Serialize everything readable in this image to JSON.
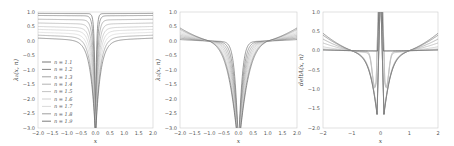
{
  "chart_data": [
    {
      "type": "line",
      "panel": "left",
      "title": "",
      "xlabel": "x",
      "ylabel": "λ₁(x, n)",
      "xlim": [
        -2.0,
        2.0
      ],
      "ylim": [
        -3.0,
        1.0
      ],
      "xticks": [
        "-2.0",
        "-1.5",
        "-1.0",
        "-0.5",
        "0.0",
        "0.5",
        "1.0",
        "1.5",
        "2.0"
      ],
      "yticks": [
        "1.0",
        "0.5",
        "0.0",
        "-0.5",
        "-1.0",
        "-1.5",
        "-2.0",
        "-2.5",
        "-3.0"
      ],
      "grid": false,
      "legend": {
        "position": "lower left",
        "entries": [
          "n = 1.1",
          "n = 1.2",
          "n = 1.3",
          "n = 1.4",
          "n = 1.5",
          "n = 1.6",
          "n = 1.7",
          "n = 1.8",
          "n = 1.9"
        ]
      },
      "series": [
        {
          "name": "n = 1.1",
          "asymptote": 0.95,
          "width": 0.04
        },
        {
          "name": "n = 1.2",
          "asymptote": 0.88,
          "width": 0.06
        },
        {
          "name": "n = 1.3",
          "asymptote": 0.75,
          "width": 0.08
        },
        {
          "name": "n = 1.4",
          "asymptote": 0.62,
          "width": 0.1
        },
        {
          "name": "n = 1.5",
          "asymptote": 0.5,
          "width": 0.12
        },
        {
          "name": "n = 1.6",
          "asymptote": 0.4,
          "width": 0.14
        },
        {
          "name": "n = 1.7",
          "asymptote": 0.3,
          "width": 0.16
        },
        {
          "name": "n = 1.8",
          "asymptote": 0.2,
          "width": 0.18
        },
        {
          "name": "n = 1.9",
          "asymptote": 0.1,
          "width": 0.2
        }
      ]
    },
    {
      "type": "line",
      "panel": "middle",
      "title": "",
      "xlabel": "x",
      "ylabel": "λ₂(x, n)",
      "xlim": [
        -2.0,
        2.0
      ],
      "ylim": [
        -3.0,
        1.0
      ],
      "xticks": [
        "-2.0",
        "-1.5",
        "-1.0",
        "-0.5",
        "0.0",
        "0.5",
        "1.0",
        "1.5",
        "2.0"
      ],
      "yticks": [
        "1.0",
        "0.5",
        "0.0",
        "-0.5",
        "-1.0",
        "-1.5",
        "-2.0",
        "-2.5",
        "-3.0"
      ],
      "grid": false,
      "annotations": [
        "curves cross near x = ±1.0 at y ≈ 0",
        "edge values at x = ±2 range from ≈0.05 to ≈0.45"
      ],
      "series": [
        {
          "name": "n = 1.1",
          "edge_value": 0.05
        },
        {
          "name": "n = 1.2",
          "edge_value": 0.1
        },
        {
          "name": "n = 1.3",
          "edge_value": 0.15
        },
        {
          "name": "n = 1.4",
          "edge_value": 0.2
        },
        {
          "name": "n = 1.5",
          "edge_value": 0.25
        },
        {
          "name": "n = 1.6",
          "edge_value": 0.3
        },
        {
          "name": "n = 1.7",
          "edge_value": 0.35
        },
        {
          "name": "n = 1.8",
          "edge_value": 0.4
        },
        {
          "name": "n = 1.9",
          "edge_value": 0.45
        }
      ]
    },
    {
      "type": "line",
      "panel": "right",
      "title": "",
      "xlabel": "x",
      "ylabel": "deltA(x, n)",
      "xlim": [
        -2,
        2
      ],
      "ylim": [
        -2.0,
        1.0
      ],
      "xticks": [
        "-2",
        "-1",
        "0",
        "1",
        "2"
      ],
      "yticks": [
        "1.0",
        "0.5",
        "0.0",
        "-0.5",
        "-1.0",
        "-1.5",
        "-2.0"
      ],
      "grid": false,
      "annotations": [
        "curves diverge upward near x = 0",
        "local minima near x = ±0.2 around y ≈ -0.8"
      ],
      "series": [
        {
          "name": "n = 1.1",
          "edge_value": 0.45
        },
        {
          "name": "n = 1.2",
          "edge_value": 0.4
        },
        {
          "name": "n = 1.3",
          "edge_value": 0.3
        },
        {
          "name": "n = 1.4",
          "edge_value": 0.2
        },
        {
          "name": "n = 1.5",
          "edge_value": 0.1
        },
        {
          "name": "n = 1.6",
          "edge_value": 0.05
        },
        {
          "name": "n = 1.7",
          "edge_value": 0.03
        },
        {
          "name": "n = 1.8",
          "edge_value": 0.02
        },
        {
          "name": "n = 1.9",
          "edge_value": 0.01
        }
      ]
    }
  ],
  "style": {
    "line_colors": [
      "#555555",
      "#666666",
      "#8a8a8a",
      "#a0a0a0",
      "#b4b4b4",
      "#c4c4c4",
      "#d0d0d0",
      "#888888",
      "#5a5a5a"
    ],
    "axis_color": "#cccccc",
    "background": "#ffffff"
  }
}
